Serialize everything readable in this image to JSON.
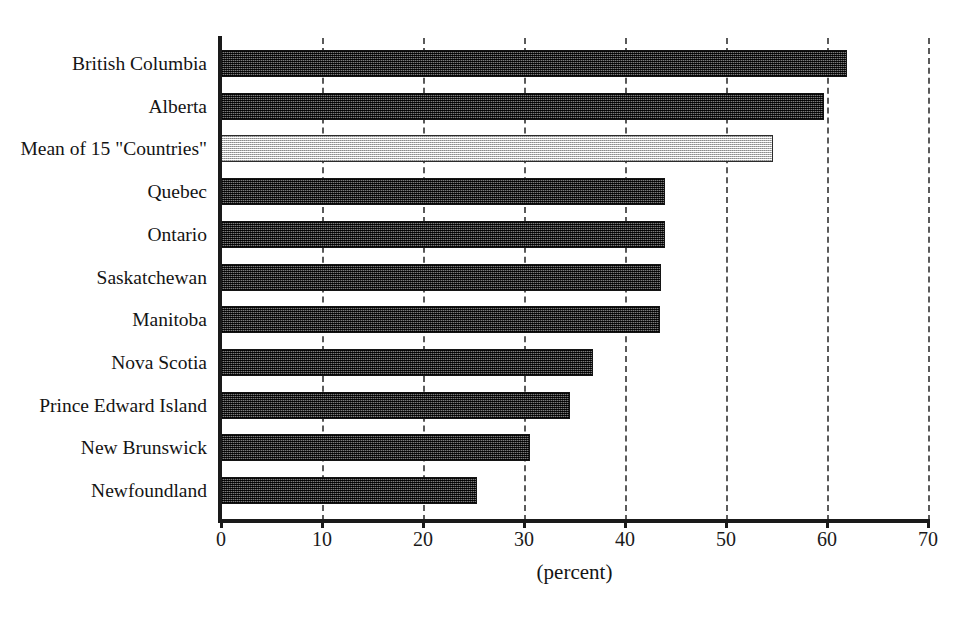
{
  "chart_data": {
    "type": "bar",
    "orientation": "horizontal",
    "title": "",
    "subtitle": "",
    "xlabel": "(percent)",
    "ylabel": "",
    "xlim": [
      0,
      70
    ],
    "xticks": [
      0,
      10,
      20,
      30,
      40,
      50,
      60,
      70
    ],
    "xtick_labels": [
      "0",
      "10",
      "20",
      "30",
      "40",
      "50",
      "60",
      "70"
    ],
    "grid": "vertical-dashed",
    "legend": "none",
    "categories": [
      "British Columbia",
      "Alberta",
      "Mean of 15 \"Countries\"",
      "Quebec",
      "Ontario",
      "Saskatchewan",
      "Manitoba",
      "Nova Scotia",
      "Prince Edward Island",
      "New Brunswick",
      "Newfoundland"
    ],
    "values": [
      62.0,
      59.7,
      54.7,
      44.0,
      44.0,
      43.6,
      43.5,
      36.8,
      34.6,
      30.6,
      25.3
    ],
    "highlight_category": "Mean of 15 \"Countries\"",
    "bar_styles": [
      "dark",
      "dark",
      "light",
      "dark",
      "dark",
      "dark",
      "dark",
      "dark",
      "dark",
      "dark",
      "dark"
    ],
    "colors": {
      "bar_dark": "#3a3a3a",
      "bar_light": "#d6d6d6",
      "bar_border": "#141414",
      "axis": "#1a1a1a",
      "gridline": "#5a5a5a",
      "text": "#141414",
      "background": "#ffffff"
    }
  }
}
